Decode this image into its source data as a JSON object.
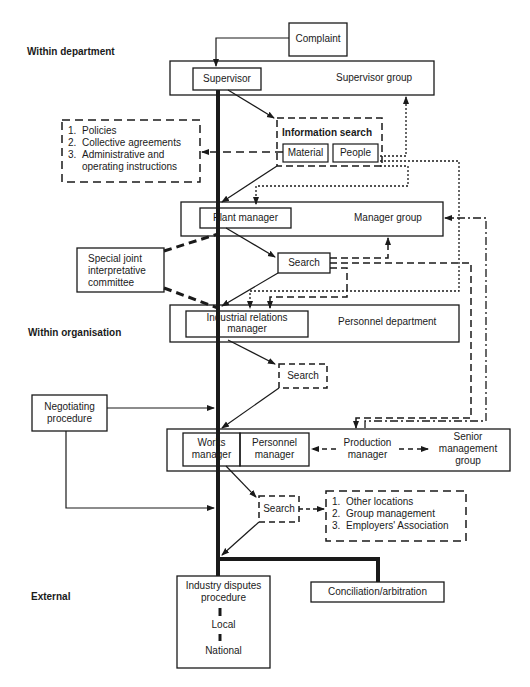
{
  "sections": {
    "within_department": "Within department",
    "within_organisation": "Within organisation",
    "external": "External"
  },
  "nodes": {
    "complaint": "Complaint",
    "supervisor": "Supervisor",
    "supervisor_group": "Supervisor group",
    "information_search": "Information search",
    "material": "Material",
    "people": "People",
    "plant_manager": "Plant manager",
    "manager_group": "Manager group",
    "special_committee": [
      "Special joint",
      "interpretative",
      "committee"
    ],
    "search_1": "Search",
    "industrial_relations_manager": [
      "Industrial relations",
      "manager"
    ],
    "personnel_department": "Personnel department",
    "search_2": "Search",
    "negotiating_procedure": [
      "Negotiating",
      "procedure"
    ],
    "works_manager": [
      "Works",
      "manager"
    ],
    "personnel_manager": [
      "Personnel",
      "manager"
    ],
    "production_manager": [
      "Production",
      "manager"
    ],
    "senior_management_group": [
      "Senior",
      "management",
      "group"
    ],
    "search_3": "Search",
    "industry_disputes_procedure": [
      "Industry disputes",
      "procedure"
    ],
    "local": "Local",
    "national": "National",
    "conciliation": "Conciliation/arbitration"
  },
  "policy_list": [
    {
      "num": "1.",
      "text": "Policies"
    },
    {
      "num": "2.",
      "text": "Collective agreements"
    },
    {
      "num": "3.",
      "text": "Administrative and"
    },
    {
      "num": "",
      "text": "operating instructions"
    }
  ],
  "external_list": [
    {
      "num": "1.",
      "text": "Other locations"
    },
    {
      "num": "2.",
      "text": "Group management"
    },
    {
      "num": "3.",
      "text": "Employers' Association"
    }
  ],
  "colors": {
    "ink": "#1a1a1a",
    "background": "#ffffff"
  }
}
